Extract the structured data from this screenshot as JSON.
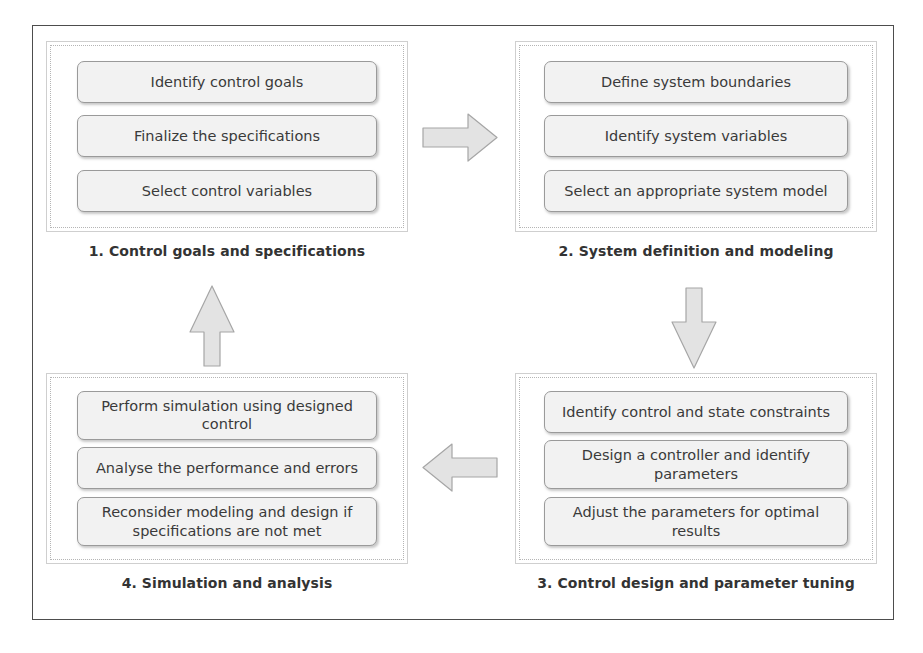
{
  "diagram": {
    "colors": {
      "frame_border": "#4d4d4d",
      "group_border": "#cfcfcf",
      "group_dotted_border": "#b5b5b5",
      "box_fill": "#f2f2f2",
      "box_border": "#9a9a9a",
      "box_text": "#3a3a3a",
      "caption_text": "#333333",
      "arrow_fill": "#e3e3e3",
      "arrow_stroke": "#a6a6a6",
      "background": "#ffffff"
    },
    "groups": [
      {
        "id": "group-1",
        "caption": "1. Control goals and specifications",
        "steps": [
          "Identify control goals",
          "Finalize the specifications",
          "Select control variables"
        ]
      },
      {
        "id": "group-2",
        "caption": "2. System definition and modeling",
        "steps": [
          "Define system boundaries",
          "Identify system variables",
          "Select an appropriate system model"
        ]
      },
      {
        "id": "group-3",
        "caption": "3. Control design and parameter tuning",
        "steps": [
          "Identify control and state constraints",
          "Design a controller and identify parameters",
          "Adjust the parameters for optimal results"
        ]
      },
      {
        "id": "group-4",
        "caption": "4. Simulation and analysis",
        "steps": [
          "Perform simulation using designed control",
          "Analyse the performance and errors",
          "Reconsider modeling and design if specifications are not met"
        ]
      }
    ],
    "arrows": [
      {
        "id": "arrow-1-to-2",
        "icon": "arrow-right-icon",
        "direction": "right",
        "from": "group-1",
        "to": "group-2"
      },
      {
        "id": "arrow-2-to-3",
        "icon": "arrow-down-icon",
        "direction": "down",
        "from": "group-2",
        "to": "group-3"
      },
      {
        "id": "arrow-3-to-4",
        "icon": "arrow-left-icon",
        "direction": "left",
        "from": "group-3",
        "to": "group-4"
      },
      {
        "id": "arrow-4-to-1",
        "icon": "arrow-up-icon",
        "direction": "up",
        "from": "group-4",
        "to": "group-1"
      }
    ]
  }
}
